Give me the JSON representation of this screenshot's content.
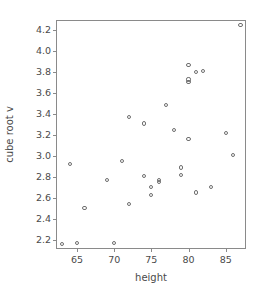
{
  "chart_data": {
    "type": "scatter",
    "title": "",
    "xlabel": "height",
    "ylabel": "cube root v",
    "xlim": [
      62.3,
      87.6
    ],
    "ylim": [
      2.12,
      4.29
    ],
    "grid": false,
    "legend": "none",
    "xticks": [
      65,
      70,
      75,
      80,
      85
    ],
    "xticklabels": [
      "65",
      "70",
      "75",
      "80",
      "85"
    ],
    "yticks": [
      2.2,
      2.4,
      2.6,
      2.8,
      3.0,
      3.2,
      3.4,
      3.6,
      3.8,
      4.0,
      4.2
    ],
    "yticklabels": [
      "2.2",
      "2.4",
      "2.6",
      "2.8",
      "3.0",
      "3.2",
      "3.4",
      "3.6",
      "3.8",
      "4.0",
      "4.2"
    ],
    "marker": "open-circle",
    "marker_color": "#6e6e6e",
    "points": [
      {
        "x": 63,
        "y": 2.16
      },
      {
        "x": 65,
        "y": 2.17
      },
      {
        "x": 70,
        "y": 2.17
      },
      {
        "x": 64,
        "y": 2.92
      },
      {
        "x": 66,
        "y": 2.5
      },
      {
        "x": 69,
        "y": 2.77
      },
      {
        "x": 71,
        "y": 2.95
      },
      {
        "x": 72,
        "y": 3.37
      },
      {
        "x": 72,
        "y": 2.54
      },
      {
        "x": 74,
        "y": 3.31
      },
      {
        "x": 74,
        "y": 2.81
      },
      {
        "x": 75,
        "y": 2.7
      },
      {
        "x": 75,
        "y": 2.63
      },
      {
        "x": 76,
        "y": 2.77
      },
      {
        "x": 76,
        "y": 2.75
      },
      {
        "x": 77,
        "y": 3.49
      },
      {
        "x": 78,
        "y": 3.25
      },
      {
        "x": 79,
        "y": 2.89
      },
      {
        "x": 79,
        "y": 2.82
      },
      {
        "x": 80,
        "y": 3.87
      },
      {
        "x": 80,
        "y": 3.73
      },
      {
        "x": 80,
        "y": 3.71
      },
      {
        "x": 80,
        "y": 3.16
      },
      {
        "x": 81,
        "y": 3.8
      },
      {
        "x": 81,
        "y": 2.65
      },
      {
        "x": 82,
        "y": 3.81
      },
      {
        "x": 83,
        "y": 2.7
      },
      {
        "x": 85,
        "y": 3.22
      },
      {
        "x": 86,
        "y": 3.01
      },
      {
        "x": 87,
        "y": 4.25
      }
    ]
  }
}
